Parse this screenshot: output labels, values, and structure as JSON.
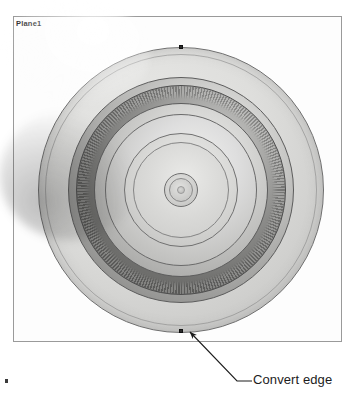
{
  "canvas": {
    "width": 354,
    "height": 415,
    "background": "#ffffff"
  },
  "sketch": {
    "frame_label": "Plane1",
    "frame_border_color": "#9a9a9a"
  },
  "model": {
    "name": "circular-part-front-view",
    "description": "Concentric machined disc viewed along its axis",
    "center": {
      "x": 181,
      "y": 190
    },
    "rings": [
      {
        "name": "flange-outer",
        "radius": 143,
        "fill": "#dedede",
        "stroke": "#6e6e6e"
      },
      {
        "name": "flange-inner-edge",
        "radius": 136,
        "fill": "none",
        "stroke": "#828282"
      },
      {
        "name": "body-outer",
        "radius": 113,
        "fill": "#a9a9a7",
        "stroke": "#5c5c5c"
      },
      {
        "name": "knurl-band",
        "radius": 105,
        "fill": "#8b8b89",
        "stroke": "#4e4e4e"
      },
      {
        "name": "dish",
        "radius": 87,
        "fill": "#bcbcba",
        "stroke": "#5d5d5d"
      },
      {
        "name": "dish-2",
        "radius": 76,
        "fill": "#c4c4c2",
        "stroke": "#6a6a6a"
      },
      {
        "name": "plateau",
        "radius": 57,
        "fill": "#c9c9c7",
        "stroke": "#717171"
      },
      {
        "name": "plateau-2",
        "radius": 48,
        "fill": "#d9d9d7",
        "stroke": "#858585"
      },
      {
        "name": "hub-outer",
        "radius": 17,
        "fill": "#cfcfcd",
        "stroke": "#6f6f6f"
      },
      {
        "name": "hub-inner",
        "radius": 12,
        "fill": "#cacac8",
        "stroke": "#8a8a8a"
      },
      {
        "name": "hub-dot",
        "radius": 4,
        "fill": "#c6c6c4",
        "stroke": "#9a9a9a"
      }
    ],
    "vertices": [
      {
        "name": "vertex-top",
        "x": 181,
        "y": 47
      },
      {
        "name": "vertex-bottom",
        "x": 181,
        "y": 331
      }
    ]
  },
  "callout": {
    "label": "Convert edge",
    "color": "#1c1c1c",
    "leader": {
      "arrow_tip": {
        "x": 190,
        "y": 332
      },
      "elbow": {
        "x": 237,
        "y": 381
      },
      "tail": {
        "x": 252,
        "y": 381
      }
    }
  },
  "artifacts": {
    "stray_dot": {
      "x": 6,
      "y": 380,
      "color": "#3a3a3a"
    }
  }
}
